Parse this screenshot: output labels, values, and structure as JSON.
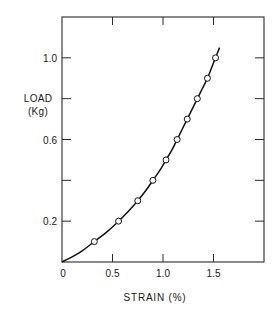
{
  "chart_data": {
    "type": "line",
    "title": "",
    "xlabel": "STRAIN (%)",
    "ylabel_line1": "LOAD",
    "ylabel_line2": "(Kg)",
    "xlim": [
      0,
      2.0
    ],
    "ylim": [
      0,
      1.2
    ],
    "x_ticks": [
      0,
      0.5,
      1.0,
      1.5,
      2.0
    ],
    "x_tick_labels": [
      "0",
      "0.5",
      "1.0",
      "1.5"
    ],
    "y_ticks": [
      0,
      0.2,
      0.4,
      0.6,
      0.8,
      1.0,
      1.2
    ],
    "y_tick_labels": [
      "0.2",
      "0.6",
      "1.0"
    ],
    "grid": false,
    "legend": null,
    "series": [
      {
        "name": "measured",
        "marker": "open-circle",
        "x": [
          0.32,
          0.56,
          0.75,
          0.9,
          1.03,
          1.14,
          1.24,
          1.34,
          1.44,
          1.52
        ],
        "y": [
          0.1,
          0.2,
          0.3,
          0.4,
          0.5,
          0.6,
          0.7,
          0.8,
          0.9,
          1.0
        ]
      },
      {
        "name": "fit-curve",
        "marker": "none",
        "x": [
          0,
          0.1,
          0.2,
          0.32,
          0.45,
          0.56,
          0.66,
          0.75,
          0.83,
          0.9,
          0.97,
          1.03,
          1.09,
          1.14,
          1.19,
          1.24,
          1.29,
          1.34,
          1.39,
          1.44,
          1.48,
          1.52,
          1.56
        ],
        "y": [
          0,
          0.025,
          0.055,
          0.1,
          0.15,
          0.2,
          0.25,
          0.3,
          0.35,
          0.4,
          0.45,
          0.5,
          0.55,
          0.6,
          0.65,
          0.7,
          0.75,
          0.8,
          0.85,
          0.9,
          0.95,
          1.0,
          1.05
        ]
      }
    ]
  }
}
